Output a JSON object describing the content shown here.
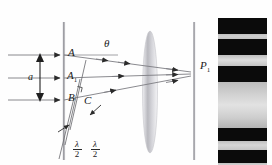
{
  "figure": {
    "background": "#fefefe",
    "width": 272,
    "height": 165,
    "top_partial_text": "",
    "colors": {
      "ray": "#7d7d82",
      "arrow": "#2b2b2b",
      "barrier": "#9a9a9e",
      "screen": "#8e8e92",
      "lens": "#bdbdc2",
      "label": "#1a1a1a",
      "fringe_dark": "#0b0b0b",
      "fringe_light": "#f2f2f2"
    }
  },
  "labels": {
    "slit_top": "A",
    "slit_mid": "A",
    "slit_mid_sub": "1",
    "slit_bottom": "B",
    "foot_point": "C",
    "slit_width": "a",
    "angle": "θ",
    "screen_point": "P",
    "screen_point_sub": "1",
    "halfwave_1_num": "λ",
    "halfwave_1_den": "2",
    "halfwave_2_num": "λ",
    "halfwave_2_den": "2"
  },
  "elements": {
    "incoming_rays": [
      {
        "name": "incoming-ray-top",
        "y": 55,
        "x1": 8,
        "x2": 60
      },
      {
        "name": "incoming-ray-middle",
        "y": 78,
        "x1": 8,
        "x2": 60
      },
      {
        "name": "incoming-ray-bottom",
        "y": 100,
        "x1": 8,
        "x2": 60
      }
    ],
    "barrier": {
      "name": "slit-barrier",
      "x": 64,
      "y1": 22,
      "y2": 160
    },
    "screen": {
      "name": "observation-screen",
      "x": 194,
      "y1": 22,
      "y2": 160
    },
    "lens": {
      "name": "converging-lens",
      "cx": 150,
      "cy": 92,
      "rx": 7,
      "ry": 60
    },
    "slit_points": [
      {
        "name": "point-A",
        "x": 64,
        "y": 55
      },
      {
        "name": "point-A1",
        "x": 64,
        "y": 78
      },
      {
        "name": "point-B",
        "x": 64,
        "y": 100
      }
    ],
    "diffracted_rays": [
      {
        "name": "diffracted-ray-from-A",
        "x1": 64,
        "y1": 55,
        "x2": 192,
        "y2": 72
      },
      {
        "name": "diffracted-ray-from-A1",
        "x1": 64,
        "y1": 78,
        "x2": 192,
        "y2": 76
      },
      {
        "name": "diffracted-ray-from-B",
        "x1": 64,
        "y1": 100,
        "x2": 192,
        "y2": 80
      }
    ],
    "wavefront_lines": [
      {
        "name": "wavefront-line-1",
        "x1": 84,
        "y1": 58,
        "x2": 68,
        "y2": 128
      },
      {
        "name": "wavefront-line-2",
        "x1": 78,
        "y1": 78,
        "x2": 63,
        "y2": 143
      },
      {
        "name": "wavefront-line-3",
        "x1": 73,
        "y1": 97,
        "x2": 58,
        "y2": 158
      }
    ],
    "dimension_arrow": {
      "name": "slit-width-dimension",
      "x": 40,
      "y1": 55,
      "y2": 100
    },
    "right_angle_marker": {
      "name": "right-angle-marker",
      "x": 80,
      "y": 88
    }
  },
  "chart_data": {
    "type": "bar",
    "orientation": "horizontal-bands",
    "x": 218,
    "y": 18,
    "width": 49,
    "height": 147,
    "bands": [
      {
        "label": "dark",
        "start": 0,
        "height": 16,
        "color": "#0b0b0b"
      },
      {
        "label": "light",
        "start": 16,
        "height": 5,
        "color": "#cfcfcf"
      },
      {
        "label": "dark",
        "start": 21,
        "height": 16,
        "color": "#0b0b0b"
      },
      {
        "label": "light",
        "start": 37,
        "height": 11,
        "color": "#dedede"
      },
      {
        "label": "dark",
        "start": 48,
        "height": 16,
        "color": "#0b0b0b"
      },
      {
        "label": "central-bright",
        "start": 64,
        "height": 46,
        "color": "#c8c8c8"
      },
      {
        "label": "dark",
        "start": 110,
        "height": 13,
        "color": "#0b0b0b"
      },
      {
        "label": "light",
        "start": 123,
        "height": 9,
        "color": "#d6d6d6"
      },
      {
        "label": "dark",
        "start": 132,
        "height": 13,
        "color": "#0b0b0b"
      },
      {
        "label": "light",
        "start": 145,
        "height": 6,
        "color": "#d9d9d9"
      },
      {
        "label": "dark",
        "start": 151,
        "height": 14,
        "color": "#0b0b0b"
      }
    ]
  }
}
